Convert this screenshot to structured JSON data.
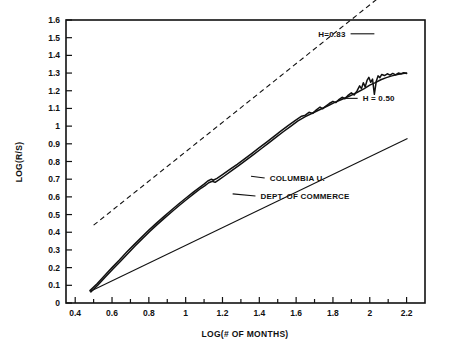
{
  "chart_data": {
    "type": "line",
    "title": "",
    "xlabel": "LOG(# OF MONTHS)",
    "ylabel": "LOG(R/S)",
    "xlim": [
      0.35,
      2.3
    ],
    "ylim": [
      0,
      1.6
    ],
    "grid": false,
    "legend_position": "inline-annotations",
    "xticks": [
      0.4,
      0.5,
      0.6,
      0.7,
      0.8,
      0.9,
      1.0,
      1.1,
      1.2,
      1.3,
      1.4,
      1.5,
      1.6,
      1.7,
      1.8,
      1.9,
      2.0,
      2.1,
      2.2
    ],
    "xtick_labels": [
      "0.4",
      "",
      "0.6",
      "",
      "0.8",
      "",
      "1",
      "",
      "1.2",
      "",
      "1.4",
      "",
      "1.6",
      "",
      "1.8",
      "",
      "2",
      "",
      "2.2"
    ],
    "yticks": [
      0,
      0.1,
      0.2,
      0.3,
      0.4,
      0.5,
      0.6,
      0.7,
      0.8,
      0.9,
      1.0,
      1.1,
      1.2,
      1.3,
      1.4,
      1.5,
      1.6
    ],
    "ytick_labels": [
      "0",
      "0.1",
      "0.2",
      "0.3",
      "0.4",
      "0.5",
      "0.6",
      "0.7",
      "0.8",
      "0.9",
      "1",
      "1.1",
      "1.2",
      "1.3",
      "1.4",
      "1.5",
      "1.6"
    ],
    "series": [
      {
        "name": "COLUMBIA U.",
        "style": "solid-jagged",
        "points": [
          [
            0.48,
            0.07
          ],
          [
            0.52,
            0.11
          ],
          [
            0.56,
            0.155
          ],
          [
            0.6,
            0.2
          ],
          [
            0.64,
            0.243
          ],
          [
            0.68,
            0.288
          ],
          [
            0.72,
            0.33
          ],
          [
            0.76,
            0.372
          ],
          [
            0.8,
            0.412
          ],
          [
            0.84,
            0.45
          ],
          [
            0.88,
            0.487
          ],
          [
            0.92,
            0.523
          ],
          [
            0.96,
            0.558
          ],
          [
            1.0,
            0.592
          ],
          [
            1.04,
            0.625
          ],
          [
            1.08,
            0.657
          ],
          [
            1.1,
            0.672
          ],
          [
            1.12,
            0.69
          ],
          [
            1.14,
            0.7
          ],
          [
            1.15,
            0.694
          ],
          [
            1.17,
            0.705
          ],
          [
            1.2,
            0.726
          ],
          [
            1.24,
            0.755
          ],
          [
            1.28,
            0.784
          ],
          [
            1.32,
            0.815
          ],
          [
            1.36,
            0.846
          ],
          [
            1.4,
            0.878
          ],
          [
            1.44,
            0.91
          ],
          [
            1.48,
            0.942
          ],
          [
            1.52,
            0.975
          ],
          [
            1.56,
            1.006
          ],
          [
            1.6,
            1.035
          ],
          [
            1.63,
            1.056
          ],
          [
            1.65,
            1.062
          ],
          [
            1.67,
            1.078
          ],
          [
            1.69,
            1.072
          ],
          [
            1.71,
            1.092
          ],
          [
            1.73,
            1.108
          ],
          [
            1.745,
            1.098
          ],
          [
            1.76,
            1.112
          ],
          [
            1.78,
            1.128
          ],
          [
            1.8,
            1.14
          ],
          [
            1.815,
            1.133
          ],
          [
            1.83,
            1.148
          ],
          [
            1.85,
            1.163
          ],
          [
            1.865,
            1.155
          ],
          [
            1.88,
            1.172
          ],
          [
            1.9,
            1.188
          ],
          [
            1.915,
            1.176
          ],
          [
            1.93,
            1.198
          ],
          [
            1.945,
            1.228
          ],
          [
            1.955,
            1.212
          ],
          [
            1.965,
            1.245
          ],
          [
            1.975,
            1.222
          ],
          [
            1.985,
            1.258
          ],
          [
            1.995,
            1.276
          ],
          [
            2.005,
            1.248
          ],
          [
            2.015,
            1.266
          ],
          [
            2.025,
            1.18
          ],
          [
            2.035,
            1.252
          ],
          [
            2.045,
            1.284
          ],
          [
            2.055,
            1.274
          ],
          [
            2.065,
            1.292
          ],
          [
            2.08,
            1.286
          ],
          [
            2.095,
            1.296
          ],
          [
            2.11,
            1.288
          ],
          [
            2.125,
            1.298
          ],
          [
            2.14,
            1.29
          ],
          [
            2.155,
            1.3
          ],
          [
            2.17,
            1.296
          ],
          [
            2.185,
            1.302
          ],
          [
            2.2,
            1.298
          ]
        ]
      },
      {
        "name": "DEPT. OF COMMERCE",
        "style": "solid-smooth",
        "points": [
          [
            0.485,
            0.062
          ],
          [
            0.525,
            0.104
          ],
          [
            0.565,
            0.148
          ],
          [
            0.605,
            0.192
          ],
          [
            0.645,
            0.235
          ],
          [
            0.685,
            0.279
          ],
          [
            0.725,
            0.322
          ],
          [
            0.765,
            0.364
          ],
          [
            0.805,
            0.404
          ],
          [
            0.845,
            0.443
          ],
          [
            0.885,
            0.48
          ],
          [
            0.925,
            0.516
          ],
          [
            0.965,
            0.551
          ],
          [
            1.005,
            0.585
          ],
          [
            1.045,
            0.618
          ],
          [
            1.085,
            0.65
          ],
          [
            1.105,
            0.664
          ],
          [
            1.125,
            0.68
          ],
          [
            1.145,
            0.688
          ],
          [
            1.16,
            0.682
          ],
          [
            1.18,
            0.696
          ],
          [
            1.21,
            0.718
          ],
          [
            1.25,
            0.748
          ],
          [
            1.29,
            0.778
          ],
          [
            1.33,
            0.809
          ],
          [
            1.37,
            0.84
          ],
          [
            1.41,
            0.872
          ],
          [
            1.45,
            0.904
          ],
          [
            1.49,
            0.936
          ],
          [
            1.53,
            0.968
          ],
          [
            1.57,
            0.999
          ],
          [
            1.61,
            1.03
          ],
          [
            1.65,
            1.054
          ],
          [
            1.69,
            1.074
          ],
          [
            1.73,
            1.094
          ],
          [
            1.77,
            1.114
          ],
          [
            1.81,
            1.134
          ],
          [
            1.85,
            1.152
          ],
          [
            1.89,
            1.17
          ],
          [
            1.93,
            1.19
          ],
          [
            1.97,
            1.212
          ],
          [
            2.0,
            1.232
          ],
          [
            2.03,
            1.246
          ],
          [
            2.06,
            1.262
          ],
          [
            2.09,
            1.274
          ],
          [
            2.12,
            1.284
          ],
          [
            2.15,
            1.292
          ],
          [
            2.18,
            1.298
          ],
          [
            2.2,
            1.3
          ]
        ]
      }
    ],
    "reference_lines": [
      {
        "name": "H=0.83",
        "label": "H=0.83",
        "style": "dashed",
        "slope": 0.83,
        "from": [
          0.5,
          0.44
        ],
        "to": [
          2.15,
          1.81
        ]
      },
      {
        "name": "H = 0.50",
        "label": "H = 0.50",
        "style": "solid",
        "slope": 0.5,
        "from": [
          0.48,
          0.065
        ],
        "to": [
          2.205,
          0.93
        ]
      }
    ],
    "annotations": [
      {
        "text": "H=0.83",
        "anchor_x": 1.885,
        "anchor_y": 1.505,
        "leader_to_x": 2.025,
        "leader_to_y": 1.505
      },
      {
        "text": "H = 0.50",
        "anchor_x": 1.945,
        "anchor_y": 1.14,
        "leader_to_x": 1.87,
        "leader_to_y": 1.14
      },
      {
        "text": "COLUMBIA U.",
        "anchor_x": 1.44,
        "anchor_y": 0.69,
        "leader_to_x": 1.355,
        "leader_to_y": 0.7
      },
      {
        "text": "DEPT. OF COMMERCE",
        "anchor_x": 1.39,
        "anchor_y": 0.588,
        "leader_to_x": 1.255,
        "leader_to_y": 0.6
      }
    ],
    "colors": {
      "axis": "#111111",
      "series_columbia": "#111111",
      "series_commerce": "#111111",
      "reference_h083": "#111111",
      "reference_h050": "#111111",
      "background": "#ffffff"
    }
  }
}
